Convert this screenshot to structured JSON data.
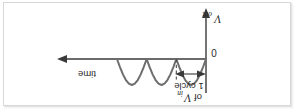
{
  "figure": {
    "caption_absent": true,
    "orientation_note": "180-degree rotated figure",
    "background_color": "#ffffff",
    "frame_color": "#d8d8d8"
  },
  "labels": {
    "time_axis": "time",
    "origin": "0",
    "vout_symbol": "V",
    "vout_subscript": "out",
    "cycle_line1": "1 cycle",
    "cycle_line2_prefix": "of ",
    "cycle_line2_symbol": "V",
    "cycle_line2_subscript": "in"
  },
  "colors": {
    "axis": "#3a3a3a",
    "waveform": "#6e6e6e",
    "dashed_tick": "#4a4a4a",
    "text": "#2b2b2b"
  },
  "chart_data": {
    "type": "line",
    "title": "",
    "subtitle": "",
    "xlabel": "time",
    "ylabel": "V_out",
    "annotations": [
      {
        "text": "0",
        "role": "origin-label"
      },
      {
        "text": "1 cycle of V_in",
        "role": "dimension-span-label"
      }
    ],
    "grid": false,
    "legend": null,
    "waveform_name": "full-wave rectified sine",
    "xlim": [
      0,
      3
    ],
    "ylim": [
      0,
      1
    ],
    "x_unit": "half-periods of V_in",
    "humps": 3,
    "hump_peak": 1.0,
    "hump_baseline": 0.0,
    "cycle_span_x": [
      1.0,
      3.0
    ],
    "dashed_tick_x": 1.0,
    "x": [
      0.0,
      0.1,
      0.2,
      0.3,
      0.4,
      0.5,
      0.6,
      0.7,
      0.8,
      0.9,
      1.0,
      1.1,
      1.2,
      1.3,
      1.4,
      1.5,
      1.6,
      1.7,
      1.8,
      1.9,
      2.0,
      2.1,
      2.2,
      2.3,
      2.4,
      2.5,
      2.6,
      2.7,
      2.8,
      2.9,
      3.0
    ],
    "y": [
      0.0,
      0.31,
      0.59,
      0.81,
      0.95,
      1.0,
      0.95,
      0.81,
      0.59,
      0.31,
      0.0,
      0.31,
      0.59,
      0.81,
      0.95,
      1.0,
      0.95,
      0.81,
      0.59,
      0.31,
      0.0,
      0.31,
      0.59,
      0.81,
      0.95,
      1.0,
      0.95,
      0.81,
      0.59,
      0.31,
      0.0
    ]
  }
}
